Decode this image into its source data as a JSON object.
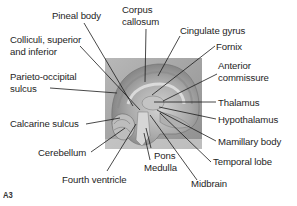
{
  "figure": {
    "id": "A3",
    "colors": {
      "background": "#ffffff",
      "text": "#1e1e1e",
      "leader_line": "#1a1a1a",
      "photo_bg": "#a9a9a9"
    },
    "photo": {
      "x": 105,
      "y": 58,
      "width": 97,
      "height": 91
    }
  },
  "labels": [
    {
      "key": "pineal_body",
      "text": "Pineal body",
      "x": 52,
      "y": 10,
      "line": [
        [
          84,
          23
        ],
        [
          133,
          106
        ]
      ]
    },
    {
      "key": "corpus_callosum_1",
      "text": "Corpus",
      "x": 122,
      "y": 4
    },
    {
      "key": "corpus_callosum_2",
      "text": "callosum",
      "x": 122,
      "y": 16,
      "line": [
        [
          146,
          29
        ],
        [
          145,
          82
        ]
      ]
    },
    {
      "key": "cingulate_gyrus",
      "text": "Cingulate gyrus",
      "x": 180,
      "y": 25,
      "line": [
        [
          180,
          36
        ],
        [
          158,
          76
        ]
      ]
    },
    {
      "key": "fornix",
      "text": "Fornix",
      "x": 216,
      "y": 41,
      "line": [
        [
          215,
          46
        ],
        [
          152,
          95
        ]
      ]
    },
    {
      "key": "anterior_commissure_1",
      "text": "Anterior",
      "x": 218,
      "y": 60
    },
    {
      "key": "anterior_commissure_2",
      "text": "commissure",
      "x": 218,
      "y": 72,
      "line": [
        [
          217,
          74
        ],
        [
          163,
          101
        ]
      ]
    },
    {
      "key": "colliculi_1",
      "text": "Colliculi, superior",
      "x": 10,
      "y": 34
    },
    {
      "key": "colliculi_2",
      "text": "and inferior",
      "x": 10,
      "y": 46,
      "line": [
        [
          80,
          46
        ],
        [
          140,
          110
        ]
      ]
    },
    {
      "key": "parieto_occipital_1",
      "text": "Parieto-occipital",
      "x": 10,
      "y": 71
    },
    {
      "key": "parieto_occipital_2",
      "text": "sulcus",
      "x": 10,
      "y": 83,
      "line": [
        [
          50,
          88
        ],
        [
          117,
          93
        ]
      ]
    },
    {
      "key": "thalamus",
      "text": "Thalamus",
      "x": 218,
      "y": 97,
      "line": [
        [
          154,
          102
        ],
        [
          216,
          102
        ]
      ]
    },
    {
      "key": "hypothalamus",
      "text": "Hypothalamus",
      "x": 218,
      "y": 114,
      "line": [
        [
          159,
          107
        ],
        [
          216,
          119
        ]
      ]
    },
    {
      "key": "calcarine_sulcus",
      "text": "Calcarine sulcus",
      "x": 10,
      "y": 118,
      "line": [
        [
          86,
          124
        ],
        [
          120,
          118
        ]
      ]
    },
    {
      "key": "mamillary_body",
      "text": "Mamillary body",
      "x": 218,
      "y": 136,
      "line": [
        [
          157,
          110
        ],
        [
          216,
          141
        ]
      ]
    },
    {
      "key": "cerebellum",
      "text": "Cerebellum",
      "x": 38,
      "y": 147,
      "line": [
        [
          91,
          152
        ],
        [
          125,
          128
        ]
      ]
    },
    {
      "key": "pons",
      "text": "Pons",
      "x": 154,
      "y": 150,
      "line": [
        [
          151,
          148
        ],
        [
          146,
          128
        ]
      ]
    },
    {
      "key": "temporal_lobe",
      "text": "Temporal lobe",
      "x": 213,
      "y": 156,
      "line": [
        [
          211,
          162
        ],
        [
          160,
          113
        ]
      ]
    },
    {
      "key": "medulla",
      "text": "Medulla",
      "x": 144,
      "y": 162,
      "line": [
        [
          150,
          160
        ],
        [
          144,
          133
        ]
      ]
    },
    {
      "key": "fourth_ventricle",
      "text": "Fourth ventricle",
      "x": 62,
      "y": 174,
      "line": [
        [
          107,
          171
        ],
        [
          136,
          124
        ]
      ]
    },
    {
      "key": "midbrain",
      "text": "Midbrain",
      "x": 191,
      "y": 178,
      "line": [
        [
          197,
          180
        ],
        [
          150,
          115
        ]
      ]
    }
  ]
}
